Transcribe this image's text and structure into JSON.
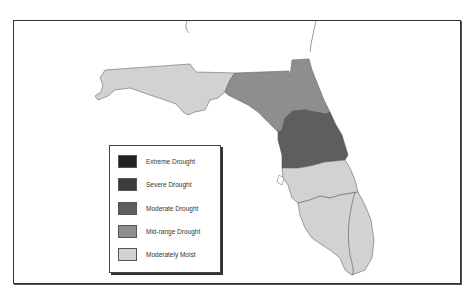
{
  "map": {
    "title": "Florida Drought Conditions",
    "regions": [
      {
        "name": "Panhandle",
        "category": "Moderately Moist",
        "color": "#d2d2d2"
      },
      {
        "name": "North Florida",
        "category": "Mid-range Drought",
        "color": "#8e8e8e"
      },
      {
        "name": "Central Florida",
        "category": "Moderate Drought",
        "color": "#5e5e5e"
      },
      {
        "name": "South Central Florida",
        "category": "Moderately Moist",
        "color": "#d2d2d2"
      },
      {
        "name": "South Florida",
        "category": "Moderately Moist",
        "color": "#d2d2d2"
      }
    ]
  },
  "legend": {
    "items": [
      {
        "label": "Extreme Drought",
        "color": "#232323"
      },
      {
        "label": "Severe Drought",
        "color": "#3c3c3c"
      },
      {
        "label": "Moderate Drought",
        "color": "#5e5e5e"
      },
      {
        "label": "Mid-range Drought",
        "color": "#8e8e8e"
      },
      {
        "label": "Moderately Moist",
        "color": "#d2d2d2"
      }
    ]
  }
}
